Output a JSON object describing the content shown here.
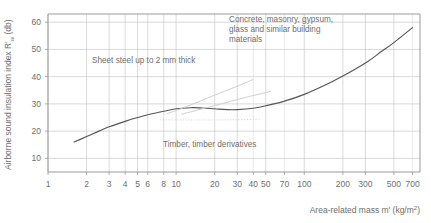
{
  "chart_data": {
    "type": "line",
    "title": "",
    "xlabel": "Area-related mass m' (kg/m2)",
    "ylabel": "Airborne sound insulation index R'w (db)",
    "x_scale": "log",
    "y_scale": "linear",
    "xlim": [
      1,
      800
    ],
    "ylim": [
      5,
      63
    ],
    "grid": "both",
    "legend_position": "none",
    "y_ticks": [
      10,
      20,
      30,
      40,
      50,
      60
    ],
    "x_ticks": [
      1,
      2,
      3,
      4,
      5,
      6,
      8,
      10,
      20,
      30,
      40,
      50,
      70,
      100,
      200,
      300,
      500,
      700
    ],
    "x_tick_labels": [
      "1",
      "2",
      "3",
      "4",
      "5",
      "6",
      "8",
      "10",
      "20",
      "30",
      "40",
      "50",
      "70",
      "100",
      "200",
      "300",
      "500",
      "700"
    ],
    "series": [
      {
        "name": "Concrete, masonry, gypsum, glass and similar building materials",
        "style": "solid",
        "color": "#555555",
        "points": [
          [
            1.6,
            16.0
          ],
          [
            2.0,
            18.0
          ],
          [
            2.5,
            20.0
          ],
          [
            3.0,
            21.6
          ],
          [
            4.0,
            23.6
          ],
          [
            5.0,
            25.0
          ],
          [
            6.0,
            26.0
          ],
          [
            8.0,
            27.3
          ],
          [
            10.0,
            28.2
          ],
          [
            13.0,
            28.6
          ],
          [
            16.0,
            28.5
          ],
          [
            20.0,
            28.2
          ],
          [
            25.0,
            27.9
          ],
          [
            30.0,
            27.9
          ],
          [
            40.0,
            28.4
          ],
          [
            50.0,
            29.3
          ],
          [
            70.0,
            31.0
          ],
          [
            100.0,
            33.5
          ],
          [
            150.0,
            37.2
          ],
          [
            200.0,
            40.2
          ],
          [
            300.0,
            45.0
          ],
          [
            400.0,
            49.2
          ],
          [
            500.0,
            52.5
          ],
          [
            700.0,
            58.0
          ]
        ]
      },
      {
        "name": "Sheet steel up to 2 mm thick",
        "style": "light-solid",
        "color": "#cfcfcf",
        "points": [
          [
            8.5,
            26.4
          ],
          [
            12.0,
            29.0
          ],
          [
            20.0,
            33.2
          ],
          [
            30.0,
            36.5
          ],
          [
            40.0,
            39.0
          ]
        ]
      },
      {
        "name": "Timber, timber derivatives (rising branch)",
        "style": "light-solid",
        "color": "#cfcfcf",
        "points": [
          [
            11.0,
            26.2
          ],
          [
            20.0,
            29.4
          ],
          [
            35.0,
            32.4
          ],
          [
            55.0,
            34.6
          ]
        ]
      },
      {
        "name": "Timber, timber derivatives (flat branch)",
        "style": "light-dotted",
        "color": "#d8d8d8",
        "points": [
          [
            7.5,
            24.2
          ],
          [
            12.0,
            24.1
          ],
          [
            20.0,
            24.1
          ],
          [
            30.0,
            24.2
          ],
          [
            45.0,
            24.3
          ]
        ]
      }
    ],
    "annotations": [
      {
        "name": "concrete-masonry-label",
        "lines": [
          "Concrete, masonry, gypsum,",
          "glass and similar building",
          "materials"
        ],
        "x_px": 229,
        "y_px": 22
      },
      {
        "name": "sheet-steel-label",
        "lines": [
          "Sheet steel up to 2 mm thick"
        ],
        "x_px": 92,
        "y_px": 63
      },
      {
        "name": "timber-label",
        "lines": [
          "Timber, timber derivatives"
        ],
        "x_px": 163,
        "y_px": 147
      }
    ]
  },
  "axes": {
    "y_title_parts": {
      "pre": "Airborne sound insulation index R'",
      "sub": "w",
      "post": " (db)"
    },
    "x_title_parts": {
      "pre": "Area-related mass m' (kg/m",
      "sup": "2",
      "post": ")"
    }
  },
  "colors": {
    "axis": "#9a9a9a",
    "grid_major": "#c9c9c9",
    "grid_minor": "#dcdcdc",
    "curve": "#555555",
    "aux": "#cfcfcf",
    "text": "#6e6e6e",
    "background": "#ffffff"
  }
}
